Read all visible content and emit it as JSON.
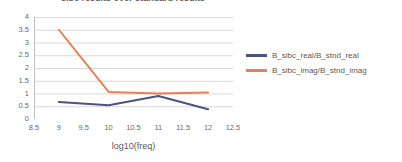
{
  "chart_data": {
    "type": "line",
    "title": "sibc results over standard results",
    "xlabel": "log10(freq)",
    "ylabel": "",
    "x": [
      9,
      10,
      11,
      12
    ],
    "xlim": [
      8.5,
      12.5
    ],
    "ylim": [
      0,
      4
    ],
    "xticks": [
      "8.5",
      "9",
      "9.5",
      "10",
      "10.5",
      "11",
      "11.5",
      "12",
      "12.5"
    ],
    "xtick_values": [
      8.5,
      9,
      9.5,
      10,
      10.5,
      11,
      11.5,
      12,
      12.5
    ],
    "yticks": [
      "0",
      "0.5",
      "1",
      "1.5",
      "2",
      "2.5",
      "3",
      "3.5",
      "4"
    ],
    "ytick_values": [
      0,
      0.5,
      1,
      1.5,
      2,
      2.5,
      3,
      3.5,
      4
    ],
    "grid": "horizontal",
    "legend_position": "right",
    "series": [
      {
        "name": "B_sibc_real/B_stnd_real",
        "color": "#4a5480",
        "values": [
          0.67,
          0.54,
          0.9,
          0.38
        ]
      },
      {
        "name": "B_sibc_imag/B_stnd_imag",
        "color": "#ed7d52",
        "values": [
          3.5,
          1.06,
          1.0,
          1.04
        ]
      }
    ]
  },
  "legend": {
    "items": [
      {
        "label": "B_sibc_real/B_stnd_real",
        "color": "#4a5480"
      },
      {
        "label": "B_sibc_imag/B_stnd_imag",
        "color": "#ed7d52"
      }
    ]
  },
  "colors": {
    "series_real": "#4a5480",
    "series_imag": "#ed7d52",
    "gridline": "#d9d9d9",
    "axis": "#bfbfbf",
    "text": "#595959",
    "background": "#ffffff"
  }
}
